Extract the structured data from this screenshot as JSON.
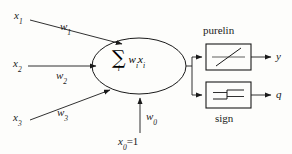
{
  "figure": {
    "type": "neural-network-neuron-diagram",
    "inputs": [
      {
        "name": "x1",
        "symbol": "x",
        "subscript": "1",
        "weight_symbol": "w",
        "weight_subscript": "1"
      },
      {
        "name": "x2",
        "symbol": "x",
        "subscript": "2",
        "weight_symbol": "w",
        "weight_subscript": "2"
      },
      {
        "name": "x3",
        "symbol": "x",
        "subscript": "3",
        "weight_symbol": "w",
        "weight_subscript": "3"
      }
    ],
    "bias": {
      "symbol": "x",
      "subscript": "0",
      "value_text": "=1",
      "weight_symbol": "w",
      "weight_subscript": "0"
    },
    "summation": {
      "operator": "∑",
      "index": "i",
      "expression_w": "w",
      "expression_w_sub": "i",
      "expression_x": "x",
      "expression_x_sub": "i"
    },
    "activations": [
      {
        "name": "purelin",
        "label": "purelin",
        "label_position": "above",
        "glyph": "linear-ramp-icon",
        "output_symbol": "y"
      },
      {
        "name": "sign",
        "label": "sign",
        "label_position": "below",
        "glyph": "step-function-icon",
        "output_symbol": "q"
      }
    ],
    "colors": {
      "stroke": "#1a1a1a",
      "text": "#1a1a1a",
      "background": "#fdfdfb"
    }
  }
}
